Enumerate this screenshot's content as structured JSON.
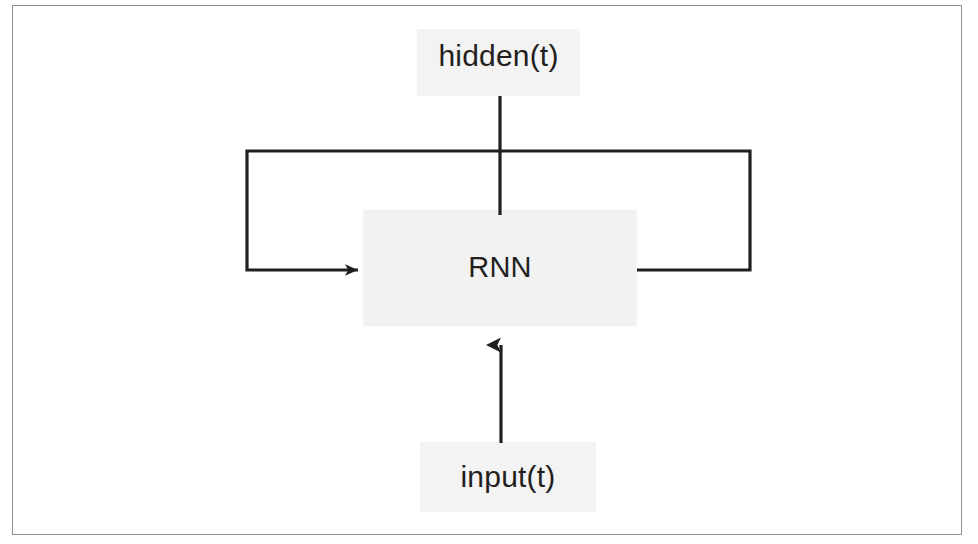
{
  "figure": {
    "type": "diagram",
    "frame": {
      "border_color": "#8e9094",
      "background_color": "#ffffff"
    },
    "nodes": [
      {
        "id": "hidden",
        "label": "hidden(t)",
        "role": "output-state",
        "plate_color": "#f3f3f3",
        "text_color": "#231f20"
      },
      {
        "id": "rnn",
        "label": "RNN",
        "role": "processing-block",
        "plate_color": "#f2f2f2",
        "text_color": "#231f20"
      },
      {
        "id": "input",
        "label": "input(t)",
        "role": "input-signal",
        "plate_color": "#f3f3f3",
        "text_color": "#231f20"
      }
    ],
    "edges": [
      {
        "id": "rnn-to-hidden",
        "from": "rnn",
        "to": "hidden",
        "style": "plain-line",
        "arrowhead": "none",
        "color": "#231f20"
      },
      {
        "id": "input-to-rnn",
        "from": "input",
        "to": "rnn",
        "style": "plain-line",
        "arrowhead": "up",
        "color": "#231f20"
      },
      {
        "id": "recurrent-loop",
        "from": "rnn",
        "to": "rnn",
        "style": "orthogonal-loop",
        "arrowhead": "right",
        "color": "#231f20",
        "description": "feedback from RNN right edge up and around to RNN left edge"
      }
    ],
    "colors": {
      "stroke": "#231f20",
      "frame": "#8e9094",
      "plate": "#f2f2f2",
      "background": "#ffffff"
    }
  }
}
